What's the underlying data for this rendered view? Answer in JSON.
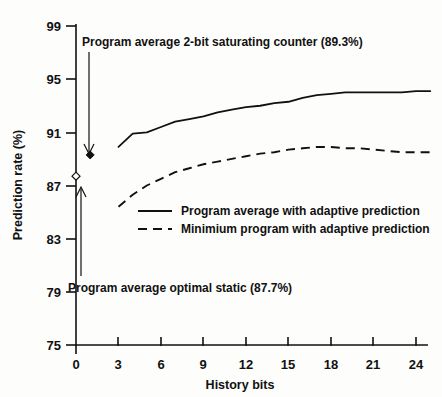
{
  "chart_data": {
    "type": "line",
    "title": "",
    "xlabel": "History bits",
    "ylabel": "Prediction rate (%)",
    "xlim": [
      0,
      26
    ],
    "ylim": [
      75,
      99
    ],
    "xticks": [
      0,
      3,
      6,
      9,
      12,
      15,
      18,
      21,
      24
    ],
    "xtick_labels": [
      "0",
      "3",
      "6",
      "9",
      "12",
      "15",
      "18",
      "21",
      "24"
    ],
    "yticks": [
      75,
      79,
      83,
      87,
      91,
      95,
      99
    ],
    "ytick_labels": [
      "75",
      "79",
      "83",
      "87",
      "91",
      "95",
      "99"
    ],
    "grid": false,
    "legend_position": "center-left-inside",
    "series": [
      {
        "name": "Program average with adaptive prediction",
        "style": "solid",
        "x": [
          3,
          4,
          5,
          6,
          7,
          8,
          9,
          10,
          11,
          12,
          13,
          14,
          15,
          16,
          17,
          18,
          19,
          20,
          21,
          22,
          23,
          24,
          25
        ],
        "values": [
          89.9,
          90.9,
          91.0,
          91.4,
          91.8,
          92.0,
          92.2,
          92.5,
          92.7,
          92.9,
          93.0,
          93.2,
          93.3,
          93.6,
          93.8,
          93.9,
          94.0,
          94.0,
          94.0,
          94.0,
          94.0,
          94.1,
          94.1
        ]
      },
      {
        "name": "Minimium program with adaptive prediction",
        "style": "dashed",
        "x": [
          3,
          4,
          5,
          6,
          7,
          8,
          9,
          10,
          11,
          12,
          13,
          14,
          15,
          16,
          17,
          18,
          19,
          20,
          21,
          22,
          23,
          24,
          25
        ],
        "values": [
          85.4,
          86.3,
          87.0,
          87.5,
          88.0,
          88.3,
          88.6,
          88.8,
          89.0,
          89.2,
          89.4,
          89.5,
          89.7,
          89.8,
          89.9,
          89.9,
          89.8,
          89.8,
          89.7,
          89.6,
          89.5,
          89.5,
          89.5
        ]
      }
    ],
    "points": [
      {
        "name": "Program average 2-bit saturating counter",
        "marker": "filled-diamond",
        "x": 1.0,
        "y": 89.3,
        "label": "Program average 2-bit saturating counter (89.3%)"
      },
      {
        "name": "Program average optimal static",
        "marker": "open-diamond",
        "x": 0.0,
        "y": 87.7,
        "label": "Program average optimal static (87.7%)"
      }
    ],
    "annotations": [
      {
        "text": "Program average 2-bit saturating counter (89.3%)",
        "arrow": "down",
        "target_value": 89.3
      },
      {
        "text": "Program average optimal static (87.7%)",
        "arrow": "up",
        "target_value": 87.7
      }
    ],
    "legend": [
      {
        "label": "Program average with adaptive prediction",
        "style": "solid"
      },
      {
        "label": "Minimium program with adaptive prediction",
        "style": "dashed"
      }
    ]
  },
  "colors": {
    "ink": "#111111",
    "background": "#fdfdfc"
  }
}
